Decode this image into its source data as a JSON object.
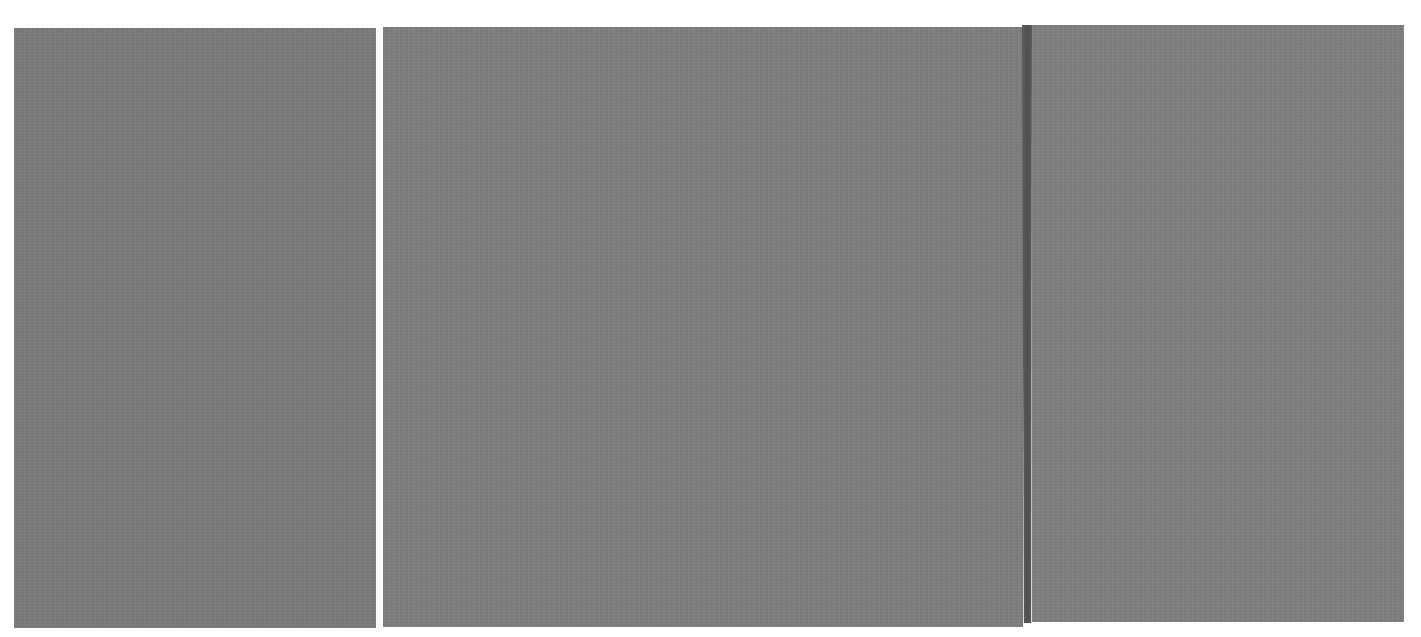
{
  "artwork": {
    "background_color": "#ffffff",
    "panels": [
      {
        "name": "left-gray-field",
        "color": "#7b7b7b",
        "x": 14,
        "y": 28,
        "width": 362,
        "height": 600
      },
      {
        "name": "middle-gray-field",
        "color": "#7e7e7e",
        "x": 383,
        "y": 27,
        "width": 640,
        "height": 600
      },
      {
        "name": "right-gray-field",
        "color": "#7f7f7f",
        "x": 1032,
        "y": 25,
        "width": 372,
        "height": 597
      }
    ],
    "stripes": [
      {
        "name": "white-vertical-stripe",
        "color": "#fafafa",
        "x": 376,
        "width": 7
      },
      {
        "name": "dark-vertical-stripe",
        "color": "#535353",
        "x": 1022,
        "width": 10
      }
    ]
  }
}
